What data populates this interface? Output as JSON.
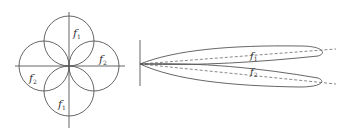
{
  "figures": {
    "left": {
      "description": "four-petal radiation pattern",
      "labels": {
        "top": {
          "main": "f",
          "sub": "1"
        },
        "right": {
          "main": "f",
          "sub": "2"
        },
        "left": {
          "main": "f",
          "sub": "2"
        },
        "bottom": {
          "main": "f",
          "sub": "1"
        }
      }
    },
    "right": {
      "description": "two narrow beam lobes",
      "labels": {
        "upper": {
          "main": "f",
          "sub": "1"
        },
        "lower": {
          "main": "f",
          "sub": "2"
        }
      }
    }
  },
  "colors": {
    "stroke": "#555555",
    "text": "#333333"
  }
}
